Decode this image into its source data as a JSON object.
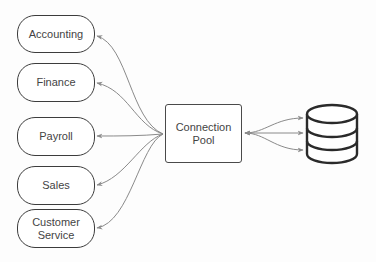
{
  "diagram": {
    "type": "architecture",
    "nodes": {
      "accounting": {
        "label": "Accounting"
      },
      "finance": {
        "label": "Finance"
      },
      "payroll": {
        "label": "Payroll"
      },
      "sales": {
        "label": "Sales"
      },
      "customer_service": {
        "label": "Customer Service"
      },
      "connection_pool": {
        "label": "Connection Pool"
      },
      "database": {
        "icon": "database-icon"
      }
    },
    "edges": [
      {
        "from": "connection_pool",
        "to": "accounting",
        "arrow": "end"
      },
      {
        "from": "connection_pool",
        "to": "finance",
        "arrow": "end"
      },
      {
        "from": "connection_pool",
        "to": "payroll",
        "arrow": "end"
      },
      {
        "from": "connection_pool",
        "to": "sales",
        "arrow": "end"
      },
      {
        "from": "connection_pool",
        "to": "customer_service",
        "arrow": "end"
      },
      {
        "from": "database",
        "to": "connection_pool",
        "arrow": "end",
        "count": 3
      },
      {
        "from": "connection_pool",
        "to": "database",
        "arrow": "end",
        "count": 3
      }
    ],
    "colors": {
      "stroke": "#3c3c3c",
      "edge": "#8a8a8a",
      "text": "#444444",
      "background": "#ffffff"
    }
  }
}
